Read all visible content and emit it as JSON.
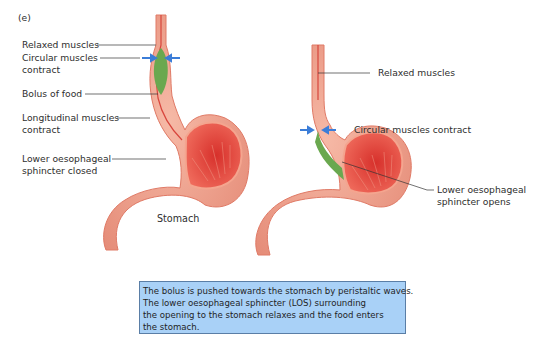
{
  "panel_label": "(e)",
  "left_diagram": {
    "labels": {
      "relaxed": "Relaxed muscles",
      "circular_1": "Circular muscles",
      "circular_2": "contract",
      "bolus": "Bolus of food",
      "longitudinal_1": "Longitudinal muscles",
      "longitudinal_2": "contract",
      "los_1": "Lower oesophageal",
      "los_2": "sphincter closed",
      "stomach": "Stomach"
    }
  },
  "right_diagram": {
    "labels": {
      "relaxed": "Relaxed muscles",
      "circular": "Circular muscles contract",
      "los_1": "Lower oesophageal",
      "los_2": "sphincter opens"
    }
  },
  "caption": {
    "lines": [
      "The bolus is pushed towards the stomach by peristaltic waves.",
      "The lower oesophageal  sphincter (LOS) surrounding",
      "the opening to the stomach relaxes and the food enters",
      "the stomach."
    ]
  },
  "colors": {
    "tissue": "#f0a08e",
    "tissue_outer": "#e8806e",
    "lumen": "#e2453f",
    "bolus": "#6aa84f",
    "arrow": "#3b7dd8",
    "caption_bg": "#a9d1f7"
  }
}
